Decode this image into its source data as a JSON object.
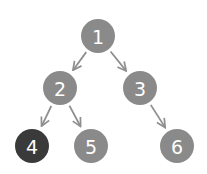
{
  "diagram": {
    "type": "binary-tree",
    "colors": {
      "node": "#8a8a8a",
      "highlight": "#3a3a3a",
      "edge": "#8f8f8f",
      "label": "#ffffff"
    },
    "nodes": [
      {
        "id": "1",
        "label": "1",
        "x": 98,
        "y": 36,
        "highlight": false
      },
      {
        "id": "2",
        "label": "2",
        "x": 60,
        "y": 88,
        "highlight": false
      },
      {
        "id": "3",
        "label": "3",
        "x": 140,
        "y": 88,
        "highlight": false
      },
      {
        "id": "4",
        "label": "4",
        "x": 32,
        "y": 146,
        "highlight": true
      },
      {
        "id": "5",
        "label": "5",
        "x": 91,
        "y": 146,
        "highlight": false
      },
      {
        "id": "6",
        "label": "6",
        "x": 177,
        "y": 146,
        "highlight": false
      }
    ],
    "edges": [
      {
        "from": "1",
        "to": "2"
      },
      {
        "from": "1",
        "to": "3"
      },
      {
        "from": "2",
        "to": "4"
      },
      {
        "from": "2",
        "to": "5"
      },
      {
        "from": "3",
        "to": "6"
      }
    ]
  }
}
